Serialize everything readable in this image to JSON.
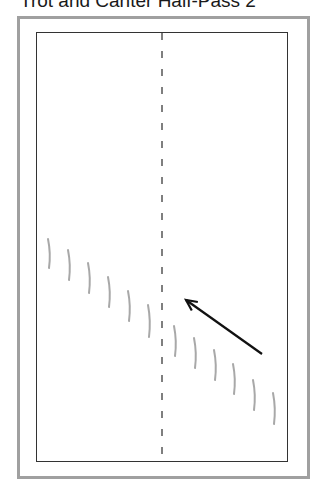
{
  "title": "Trot and Canter Half-Pass 2",
  "diagram": {
    "outer_frame": {
      "x": 17,
      "y": 16,
      "w": 290,
      "h": 460,
      "color": "#a0a0a0"
    },
    "arena": {
      "x": 36,
      "y": 32,
      "w": 251,
      "h": 429,
      "color": "#333333"
    },
    "centerline": {
      "x": 162,
      "y1": 33,
      "y2": 460,
      "dash": "7 11",
      "color": "#555555"
    },
    "hoof_prints_color": "#a8a8a8",
    "hoof_prints": [
      {
        "x": 49,
        "y1": 239,
        "y2": 268
      },
      {
        "x": 69,
        "y1": 250,
        "y2": 280
      },
      {
        "x": 89,
        "y1": 263,
        "y2": 293
      },
      {
        "x": 109,
        "y1": 277,
        "y2": 307
      },
      {
        "x": 129,
        "y1": 291,
        "y2": 321
      },
      {
        "x": 149,
        "y1": 305,
        "y2": 337
      },
      {
        "x": 175,
        "y1": 326,
        "y2": 356
      },
      {
        "x": 195,
        "y1": 338,
        "y2": 368
      },
      {
        "x": 215,
        "y1": 350,
        "y2": 380
      },
      {
        "x": 234,
        "y1": 364,
        "y2": 394
      },
      {
        "x": 254,
        "y1": 380,
        "y2": 410
      },
      {
        "x": 274,
        "y1": 393,
        "y2": 424
      }
    ],
    "arrow": {
      "x1": 262,
      "y1": 354,
      "x2": 186,
      "y2": 300,
      "color": "#111111"
    }
  }
}
